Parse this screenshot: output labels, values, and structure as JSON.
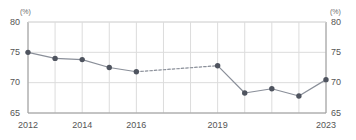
{
  "chart_data": {
    "type": "line",
    "title": "",
    "xlabel": "",
    "ylabel": "",
    "unit_label_left": "(%)",
    "unit_label_right": "(%)",
    "ylim": [
      65,
      80
    ],
    "yticks": [
      65,
      70,
      75,
      80
    ],
    "ytick_labels_left": [
      "65",
      "70",
      "75",
      "80"
    ],
    "ytick_labels_right": [
      "65",
      "70",
      "75",
      "80"
    ],
    "xlim": [
      2012,
      2023
    ],
    "xticks": [
      2012,
      2013,
      2014,
      2015,
      2016,
      2017,
      2018,
      2019,
      2020,
      2021,
      2022,
      2023
    ],
    "xtick_labels_shown": [
      "2012",
      "2014",
      "2016",
      "2019",
      "2023"
    ],
    "xtick_labels_shown_years": [
      2012,
      2014,
      2016,
      2019,
      2023
    ],
    "grid": true,
    "legend": "none",
    "x": [
      2012,
      2013,
      2014,
      2015,
      2016,
      2019,
      2020,
      2021,
      2022,
      2023
    ],
    "values": [
      75.0,
      74.0,
      73.8,
      72.5,
      71.8,
      72.8,
      68.3,
      69.0,
      67.8,
      70.5
    ],
    "series": [
      {
        "name": "rate",
        "points": [
          {
            "x": 2012,
            "y": 75.0
          },
          {
            "x": 2013,
            "y": 74.0
          },
          {
            "x": 2014,
            "y": 73.8
          },
          {
            "x": 2015,
            "y": 72.5
          },
          {
            "x": 2016,
            "y": 71.8
          },
          {
            "x": 2019,
            "y": 72.8
          },
          {
            "x": 2020,
            "y": 68.3
          },
          {
            "x": 2021,
            "y": 69.0
          },
          {
            "x": 2022,
            "y": 67.8
          },
          {
            "x": 2023,
            "y": 70.5
          }
        ],
        "dashed_segments": [
          [
            2016,
            2019
          ]
        ],
        "marker_color": "#4f545f",
        "line_color": "#8a8f99"
      }
    ],
    "colors": {
      "marker": "#4f545f",
      "line": "#8a8f99",
      "grid": "#dcdcdc",
      "axis": "#9a9a9a",
      "tick_text": "#555555",
      "unit_text": "#6b6b6b",
      "background": "#ffffff"
    }
  }
}
